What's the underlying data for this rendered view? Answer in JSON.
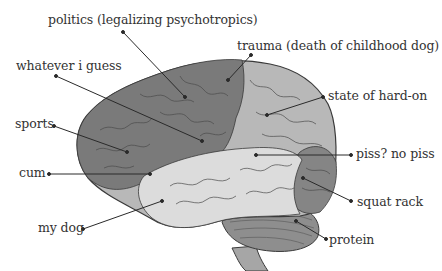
{
  "diagram": {
    "colors": {
      "background": "#ffffff",
      "frontal_lobe": "#7a7a7a",
      "parietal_lobe": "#b8b8b8",
      "temporal_lobe": "#dcdcdc",
      "occipital_lobe": "#858585",
      "cerebellum": "#8e8e8e",
      "brainstem": "#a6a6a6",
      "outline": "#3a3a3a",
      "leader_line": "#2a2a2a",
      "text": "#333333"
    },
    "labels": [
      {
        "id": "politics",
        "text": "politics (legalizing psychotropics)"
      },
      {
        "id": "trauma",
        "text": "trauma (death of childhood dog)"
      },
      {
        "id": "whatever",
        "text": "whatever i guess"
      },
      {
        "id": "hardon",
        "text": "state of hard-on"
      },
      {
        "id": "sports",
        "text": "sports"
      },
      {
        "id": "cum",
        "text": "cum"
      },
      {
        "id": "piss",
        "text": "piss? no piss"
      },
      {
        "id": "squat",
        "text": "squat rack"
      },
      {
        "id": "mydog",
        "text": "my dog"
      },
      {
        "id": "protein",
        "text": "protein"
      }
    ]
  }
}
